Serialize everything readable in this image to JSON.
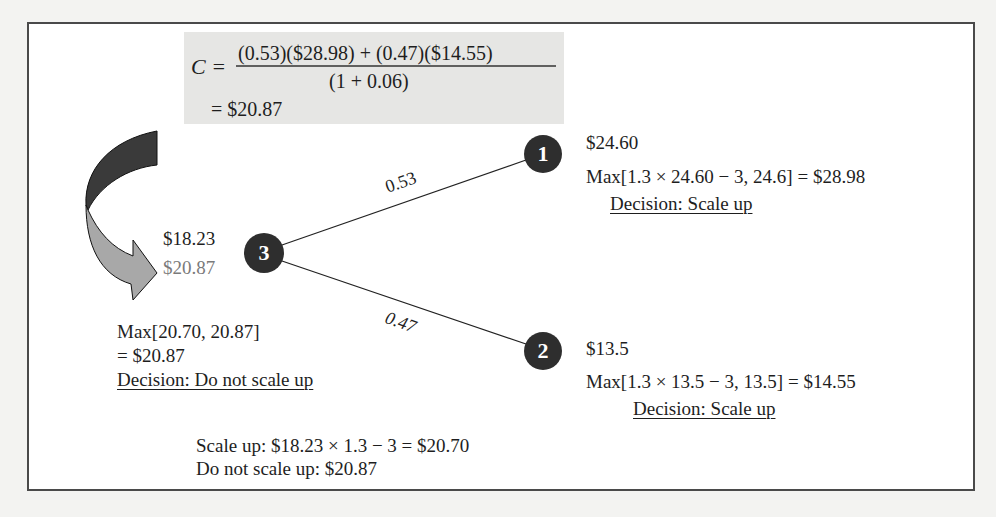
{
  "formula": {
    "lhs": "C =",
    "numerator": "(0.53)($28.98) + (0.47)($14.55)",
    "denominator": "(1 + 0.06)",
    "result": "= $20.87"
  },
  "nodes": {
    "node3": {
      "label": "3",
      "underlying_value": "$18.23",
      "option_value": "$20.87",
      "max_expression": "Max[20.70, 20.87]",
      "max_result": "= $20.87",
      "decision": "Decision: Do not scale up"
    },
    "node1": {
      "label": "1",
      "value": "$24.60",
      "max_expression": "Max[1.3 × 24.60 − 3, 24.6] = $28.98",
      "decision": "Decision: Scale up"
    },
    "node2": {
      "label": "2",
      "value": "$13.5",
      "max_expression": "Max[1.3 × 13.5 − 3, 13.5] = $14.55",
      "decision": "Decision: Scale up"
    }
  },
  "branches": {
    "up_probability": "0.53",
    "down_probability": "0.47"
  },
  "footnote": {
    "scale_up": "Scale up: $18.23 × 1.3 − 3 = $20.70",
    "do_not_scale_up": "Do not scale up: $20.87"
  },
  "colors": {
    "node_fill": "#2e2e2e",
    "arrow_dark": "#3a3a3a",
    "arrow_light": "#a8a8a8",
    "formula_bg": "#e6e6e4",
    "gray_text": "#7a7a7a"
  }
}
